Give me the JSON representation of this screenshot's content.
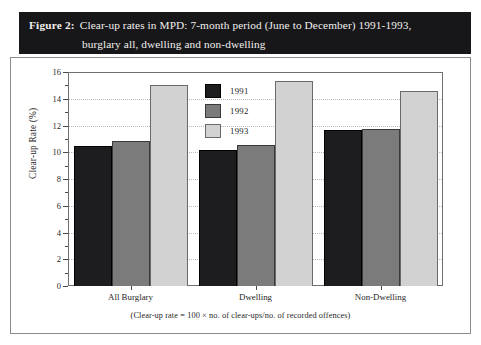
{
  "figure": {
    "label": "Figure 2:",
    "title_line1": "Clear-up rates in MPD: 7-month period (June to December) 1991-1993,",
    "title_line2": "burglary all, dwelling and non-dwelling",
    "footnote": "(Clear-up rate = 100 × no. of clear-ups/no. of recorded offences)",
    "title_bar_color": "#17171a",
    "frame_color": "#8c8c8c"
  },
  "chart_data": {
    "type": "bar",
    "title": "Clear-up rates in MPD: 7-month period (June to December) 1991-1993, burglary all, dwelling and non-dwelling",
    "xlabel": "",
    "ylabel": "Clear-up Rate (%)",
    "categories": [
      "All Burglary",
      "Dwelling",
      "Non-Dwelling"
    ],
    "series": [
      {
        "name": "1991",
        "color": "#1d1d1f",
        "values": [
          10.45,
          10.15,
          11.7
        ]
      },
      {
        "name": "1992",
        "color": "#7b7b7b",
        "values": [
          10.85,
          10.55,
          11.75
        ]
      },
      {
        "name": "1993",
        "color": "#d2d2d2",
        "values": [
          15.05,
          15.3,
          14.55
        ]
      }
    ],
    "ylim": [
      0,
      16
    ],
    "ytick_major": [
      0,
      2,
      4,
      6,
      8,
      10,
      12,
      14,
      16
    ],
    "ytick_minor": [
      1,
      3,
      5,
      7,
      9,
      11,
      13,
      15
    ],
    "ytick_labels": [
      "0",
      "2",
      "4",
      "6",
      "8",
      "10",
      "12",
      "14",
      "16"
    ],
    "grid": true,
    "grid_axis": "y",
    "legend_position": "center-top-inside",
    "legend_entries": [
      "1991",
      "1992",
      "1993"
    ]
  }
}
